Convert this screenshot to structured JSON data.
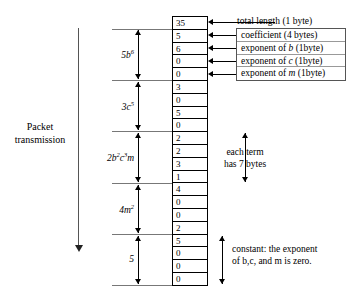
{
  "diagram": {
    "packet_axis_label": "Packet\ntransmission",
    "packet_label_line1": "Packet",
    "packet_label_line2": "transmission"
  },
  "byte_table": {
    "cells": [
      {
        "value": "35",
        "group_end": true
      },
      {
        "value": "5",
        "group_end": false
      },
      {
        "value": "6",
        "group_end": false
      },
      {
        "value": "0",
        "group_end": false
      },
      {
        "value": "0",
        "group_end": true
      },
      {
        "value": "3",
        "group_end": false
      },
      {
        "value": "0",
        "group_end": false
      },
      {
        "value": "5",
        "group_end": false
      },
      {
        "value": "0",
        "group_end": true
      },
      {
        "value": "2",
        "group_end": false
      },
      {
        "value": "2",
        "group_end": false
      },
      {
        "value": "3",
        "group_end": false
      },
      {
        "value": "1",
        "group_end": true
      },
      {
        "value": "4",
        "group_end": false
      },
      {
        "value": "0",
        "group_end": false
      },
      {
        "value": "0",
        "group_end": false
      },
      {
        "value": "2",
        "group_end": true
      },
      {
        "value": "5",
        "group_end": false
      },
      {
        "value": "0",
        "group_end": false
      },
      {
        "value": "0",
        "group_end": false
      },
      {
        "value": "0",
        "group_end": false
      }
    ]
  },
  "legend": {
    "total_length": "total length (1 byte)",
    "rows": [
      {
        "text_before": "coefficient (4 bytes)",
        "italic": "",
        "text_after": ""
      },
      {
        "text_before": "exponent of ",
        "italic": "b",
        "text_after": " (1byte)"
      },
      {
        "text_before": "exponent of ",
        "italic": "c",
        "text_after": " (1byte)"
      },
      {
        "text_before": "exponent of ",
        "italic": "m",
        "text_after": " (1byte)"
      }
    ]
  },
  "terms": [
    {
      "coefficient": "5",
      "base": "b",
      "exponent": "6",
      "label_html": "5b",
      "sup": "6"
    },
    {
      "coefficient": "3",
      "base": "c",
      "exponent": "5",
      "label_html": "3c",
      "sup": "5"
    },
    {
      "coefficient": "2",
      "base": "b",
      "exponent": "2",
      "label_html": "2b",
      "sup": "2"
    },
    {
      "coefficient": "4",
      "base": "m",
      "exponent": "2",
      "label_html": "4m",
      "sup": "2"
    },
    {
      "coefficient": "5",
      "base": "",
      "exponent": "",
      "label_html": "5",
      "sup": ""
    }
  ],
  "term_labels": {
    "t1_main": "5b",
    "t1_sup": "6",
    "t2_main": "3c",
    "t2_sup": "5",
    "t3_main": "2b",
    "t3_sup": "2",
    "t3_mid": "c",
    "t3_sup2": "3",
    "t3_tail": "m",
    "t4_main": "4m",
    "t4_sup": "2",
    "t5_main": "5"
  },
  "notes": {
    "each_term_line1": "each term",
    "each_term_line2": "has 7 bytes",
    "constant_line1": "constant: the exponent",
    "constant_line2": "of b,c, and m is zero."
  }
}
